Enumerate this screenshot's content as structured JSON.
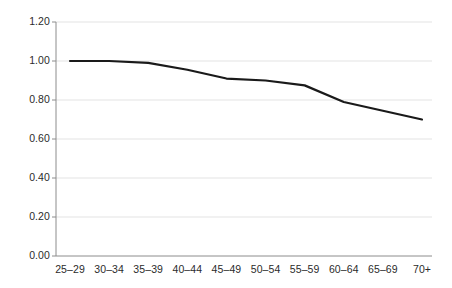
{
  "chart_data": {
    "type": "line",
    "title": "",
    "subtitle": "",
    "xlabel": "",
    "ylabel": "",
    "categories": [
      "25–29",
      "30–34",
      "35–39",
      "40–44",
      "45–49",
      "50–54",
      "55–59",
      "60–64",
      "65–69",
      "70+"
    ],
    "series": [
      {
        "name": "index",
        "values": [
          1.0,
          1.0,
          0.99,
          0.955,
          0.91,
          0.9,
          0.875,
          0.79,
          0.745,
          0.7
        ]
      }
    ],
    "ylim": [
      0.0,
      1.2
    ],
    "yticks": [
      0.0,
      0.2,
      0.4,
      0.6,
      0.8,
      1.0,
      1.2
    ],
    "ytick_labels": [
      "0.00",
      "0.20",
      "0.40",
      "0.60",
      "0.80",
      "1.00",
      "1.20"
    ],
    "grid": true,
    "grid_axis": "y",
    "legend": false,
    "legend_position": "none",
    "annotations": [],
    "line_color": "#1a1a1a",
    "grid_color": "#e3e3e3",
    "axis_color": "#8c8c8c",
    "text_color": "#2b2b2b",
    "background_color": "#ffffff"
  }
}
